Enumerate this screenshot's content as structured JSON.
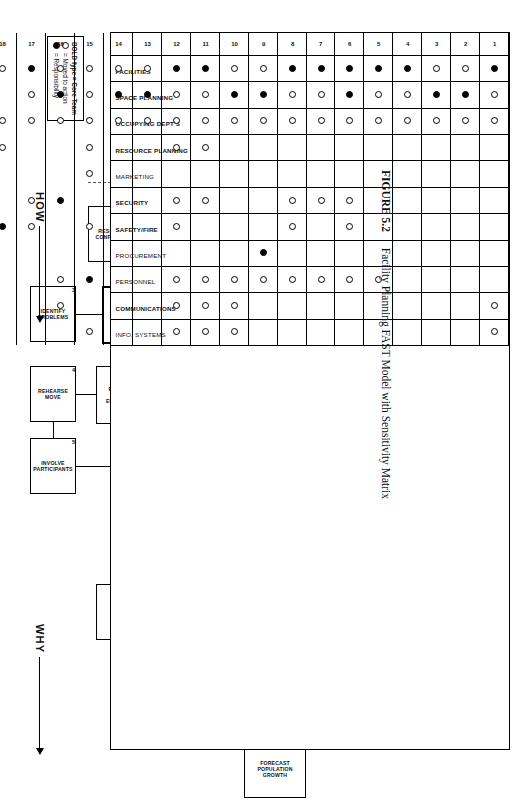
{
  "figure": {
    "number": "FIGURE 5.2",
    "caption": "Facility Planning FAST Model with Sensitivity Matrix"
  },
  "directions": [
    {
      "id": "why",
      "label": "WHY"
    },
    {
      "id": "how",
      "label": "HOW"
    },
    {
      "id": "when",
      "label": "WHEN"
    }
  ],
  "diagram": {
    "nodes": [
      {
        "id": "accommodate-needs",
        "num": "",
        "label": "ACCOMMODATE\nNEEDS",
        "bold": false,
        "x": 18,
        "y": 300,
        "w": 62,
        "h": 46
      },
      {
        "id": "occupy-space",
        "num": "0",
        "label": "OCCUPY\nSPACE",
        "bold": false,
        "x": 104,
        "y": 300,
        "w": 56,
        "h": 46
      },
      {
        "id": "implement-move",
        "num": "1",
        "label": "IMPLEMENT\nMOVE",
        "bold": true,
        "x": 192,
        "y": 296,
        "w": 60,
        "h": 54
      },
      {
        "id": "resolve-conflicts",
        "num": "2",
        "label": "RESOLVE\nCONFLICTS",
        "bold": false,
        "x": 192,
        "y": 382,
        "w": 56,
        "h": 46
      },
      {
        "id": "construct-space",
        "num": "6",
        "label": "CONSTRUCT\nSPACE",
        "bold": true,
        "x": 272,
        "y": 230,
        "w": 58,
        "h": 52
      },
      {
        "id": "lease-space",
        "num": "7",
        "label": "LEASE\nSPACE",
        "bold": true,
        "x": 272,
        "y": 296,
        "w": 58,
        "h": 52
      },
      {
        "id": "re-arrange-space",
        "num": "8",
        "label": "RE-ARRANGE\nSPACE",
        "bold": true,
        "x": 272,
        "y": 362,
        "w": 58,
        "h": 52
      },
      {
        "id": "identify-problems",
        "num": "3",
        "label": "IDENTIFY\nPROBLEMS",
        "bold": false,
        "x": 272,
        "y": 440,
        "w": 56,
        "h": 46
      },
      {
        "id": "allocate-space",
        "num": "10",
        "label": "ALLOCATE\nSPACE",
        "bold": true,
        "x": 352,
        "y": 296,
        "w": 58,
        "h": 52
      },
      {
        "id": "procure-capital-equip",
        "num": "9",
        "label": "PROCURE\nCAPITAL\nEQUIPMENT",
        "bold": false,
        "x": 352,
        "y": 368,
        "w": 58,
        "h": 52
      },
      {
        "id": "rehearse-move",
        "num": "4",
        "label": "REHEARSE\nMOVE",
        "bold": false,
        "x": 352,
        "y": 440,
        "w": 56,
        "h": 46
      },
      {
        "id": "execute-plan",
        "num": "11",
        "label": "EXECUTE\nPLAN",
        "bold": true,
        "x": 424,
        "y": 296,
        "w": 58,
        "h": 52
      },
      {
        "id": "involve-participants",
        "num": "5",
        "label": "INVOLVE\nPARTICIPANTS",
        "bold": false,
        "x": 424,
        "y": 440,
        "w": 56,
        "h": 46
      },
      {
        "id": "create-plan",
        "num": "12",
        "label": "CREATE\nPLAN",
        "bold": true,
        "x": 496,
        "y": 296,
        "w": 58,
        "h": 52
      },
      {
        "id": "define-space-reqs",
        "num": "14",
        "label": "DEFINE SPACE\nREQUIREMENTS",
        "bold": true,
        "x": 570,
        "y": 288,
        "w": 60,
        "h": 62
      },
      {
        "id": "layout-office-space",
        "num": "13",
        "label": "LAYOUT\nOFFICE\nSPACE",
        "bold": false,
        "x": 570,
        "y": 370,
        "w": 56,
        "h": 50
      },
      {
        "id": "assess-comm-needs",
        "num": "15",
        "label": "ASSESS\nCOMMUNICATION\nNEEDS",
        "bold": false,
        "x": 570,
        "y": 216,
        "w": 56,
        "h": 52
      },
      {
        "id": "determine-traffic",
        "num": "17",
        "label": "DETERMINE\nTRAFFIC\nPATTERNS",
        "bold": false,
        "x": 570,
        "y": 144,
        "w": 56,
        "h": 52
      },
      {
        "id": "define-safety-reqmts",
        "num": "18",
        "label": "DEFINE\nSAFETY\nREQMNTS",
        "bold": false,
        "x": 570,
        "y": 70,
        "w": 56,
        "h": 50
      },
      {
        "id": "define-security-reqmts",
        "num": "16",
        "label": "DEFINE\nSECURITY\nREQMNTS",
        "bold": false,
        "x": 500,
        "y": 144,
        "w": 56,
        "h": 52
      },
      {
        "id": "determine-activities",
        "num": "19",
        "label": "DETERMINE\nACTIVITIES",
        "bold": true,
        "x": 648,
        "y": 288,
        "w": 58,
        "h": 62
      },
      {
        "id": "analyze-resource-needs",
        "num": "20",
        "label": "ANALYZE\nRESOURCE\nNEEDS",
        "bold": true,
        "x": 648,
        "y": 216,
        "w": 58,
        "h": 62
      },
      {
        "id": "identify-growth-depts",
        "num": "21",
        "label": "IDENTIFY\nGROWTH\nDEPARTMENTS",
        "bold": true,
        "x": 648,
        "y": 144,
        "w": 58,
        "h": 62
      },
      {
        "id": "confirm-headcount",
        "num": "22",
        "label": "CONFIRM\nHEADCOUNT",
        "bold": false,
        "x": 650,
        "y": 74,
        "w": 54,
        "h": 52
      },
      {
        "id": "inventory-furniture",
        "num": "23",
        "label": "INVENTORY\nFURNITURE",
        "bold": false,
        "x": 650,
        "y": 8,
        "w": 54,
        "h": 52
      },
      {
        "id": "forecast-pop-growth",
        "num": "24",
        "label": "FORECAST\nPOPULATION\nGROWTH",
        "bold": false,
        "x": 726,
        "y": 210,
        "w": 58,
        "h": 62
      }
    ]
  },
  "legend": {
    "title": "BOLD type = Core Team",
    "items": [
      {
        "symbol": "open-circle",
        "text": "= Moved to action"
      },
      {
        "symbol": "filled-circle",
        "text": "= Responsibility"
      }
    ]
  },
  "chart_data": {
    "type": "heatmap",
    "title": "Facility Planning FAST Model with Sensitivity Matrix",
    "xlabel": "Function / Activity number",
    "ylabel": "Department",
    "legend": {
      "open-circle": "Moved to action",
      "filled-circle": "Responsibility"
    },
    "columns": [
      "1",
      "2",
      "3",
      "4",
      "5",
      "6",
      "7",
      "8",
      "9",
      "10",
      "11",
      "12",
      "13",
      "14",
      "15",
      "16",
      "17",
      "18",
      "19",
      "20",
      "21",
      "22",
      "23",
      "24"
    ],
    "rows": [
      {
        "label": "FACILITIES",
        "bold": true,
        "open": [
          2,
          3,
          9,
          10,
          13,
          14,
          15,
          16,
          18,
          20,
          21,
          22,
          23,
          24
        ],
        "filled": [
          1,
          4,
          5,
          6,
          7,
          8,
          11,
          12,
          17,
          19
        ]
      },
      {
        "label": "SPACE PLANNING",
        "bold": true,
        "open": [
          1,
          4,
          5,
          7,
          8,
          11,
          12,
          15,
          17,
          19,
          21,
          24
        ],
        "filled": [
          2,
          3,
          6,
          9,
          10,
          13,
          14,
          16,
          20,
          22,
          23
        ]
      },
      {
        "label": "OCCUPYING DEPT'S",
        "bold": true,
        "open": [
          1,
          2,
          3,
          4,
          5,
          6,
          7,
          8,
          9,
          10,
          11,
          12,
          13,
          14,
          15,
          16,
          17,
          18,
          19,
          21,
          24
        ],
        "filled": [
          20,
          22,
          23
        ]
      },
      {
        "label": "RESOURCE PLANNING",
        "bold": true,
        "open": [
          11,
          12,
          15,
          18,
          19,
          21
        ],
        "filled": [
          24
        ]
      },
      {
        "label": "MARKETING",
        "bold": false,
        "open": [
          15,
          21,
          24
        ],
        "filled": []
      },
      {
        "label": "SECURITY",
        "bold": true,
        "open": [
          6,
          7,
          8,
          11,
          12,
          17,
          19
        ],
        "filled": [
          16
        ]
      },
      {
        "label": "SAFETY/FIRE",
        "bold": true,
        "open": [
          6,
          8,
          12,
          15,
          17,
          19,
          20
        ],
        "filled": [
          18
        ]
      },
      {
        "label": "PROCUREMENT",
        "bold": false,
        "open": [
          19
        ],
        "filled": [
          9
        ]
      },
      {
        "label": "PERSONNEL",
        "bold": false,
        "open": [
          5,
          6,
          7,
          8,
          9,
          10,
          11,
          12,
          16,
          19,
          20,
          21,
          22
        ],
        "filled": [
          15
        ]
      },
      {
        "label": "COMMUNICATIONS",
        "bold": true,
        "open": [
          1,
          10,
          11,
          12,
          16,
          19,
          20,
          22
        ],
        "filled": []
      },
      {
        "label": "INFO. SYSTEMS",
        "bold": false,
        "open": [
          1,
          10,
          11,
          12,
          15,
          19,
          20
        ],
        "filled": []
      }
    ]
  }
}
